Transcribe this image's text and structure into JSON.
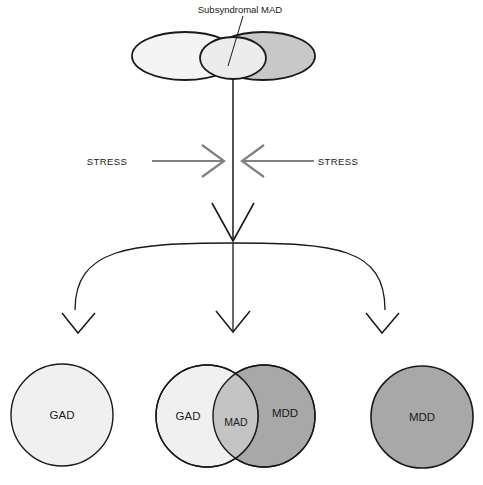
{
  "figure": {
    "title_label": "Subsyndromal MAD",
    "stress_left_label": "STRESS",
    "stress_right_label": "STRESS",
    "top_left_ellipse_label": "",
    "top_mid_ellipse_label": "",
    "top_right_ellipse_label": "",
    "outcome_left_label": "GAD",
    "outcome_mid_gad_label": "GAD",
    "outcome_mid_overlap_label": "MAD",
    "outcome_mid_mdd_label": "MDD",
    "outcome_right_label": "MDD",
    "colors": {
      "background": "#ffffff",
      "stroke": "#1a1a1a",
      "arrow_gray": "#808080",
      "fill_light": "#f0f0f0",
      "fill_mid": "#c8c8c8",
      "fill_dark": "#a8a8a8",
      "text": "#1a1a1a"
    }
  }
}
